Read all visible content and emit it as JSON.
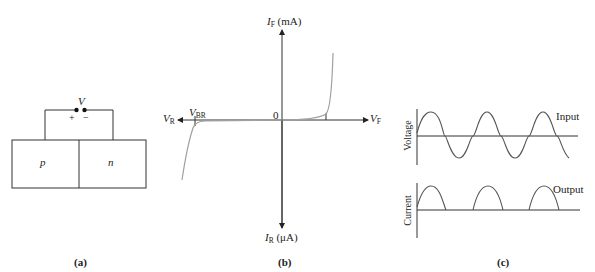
{
  "panel_a": {
    "caption": "(a)",
    "voltage_label": "V",
    "plus": "+",
    "minus": "−",
    "region_p": "p",
    "region_n": "n"
  },
  "panel_b": {
    "caption": "(b)",
    "y_pos_label": "I",
    "y_pos_sub": "F",
    "y_pos_unit": " (mA)",
    "y_neg_label": "I",
    "y_neg_sub": "R",
    "y_neg_unit": " (μA)",
    "x_pos_label": "V",
    "x_pos_sub": "F",
    "x_neg_label": "V",
    "x_neg_sub": "R",
    "breakdown_label": "V",
    "breakdown_sub": "BR",
    "origin_label": "0"
  },
  "panel_c": {
    "caption": "(c)",
    "top_ylabel": "Voltage",
    "top_legend": "Input",
    "bottom_ylabel": "Current",
    "bottom_legend": "Output"
  },
  "colors": {
    "line": "#333333",
    "curve": "#a0a0a0"
  }
}
